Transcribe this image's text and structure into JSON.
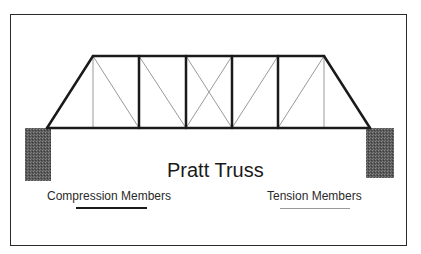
{
  "diagram": {
    "title": "Pratt Truss",
    "legend": {
      "compression": {
        "label": "Compression Members",
        "color": "#1a1a1a",
        "line_style": "thick"
      },
      "tension": {
        "label": "Tension Members",
        "color": "#9a9a9a",
        "line_style": "thin"
      }
    },
    "truss": {
      "type": "Pratt",
      "panels": 7,
      "bottom_nodes_x": [
        47,
        93,
        139,
        186,
        232,
        278,
        324,
        370
      ],
      "top_nodes_x": [
        93,
        139,
        186,
        232,
        278,
        324
      ],
      "top_chord_y": 56,
      "bottom_chord_y": 128,
      "compression_members": [
        "top-chord",
        "left-end-post",
        "right-end-post",
        "bottom-chord",
        "vertical-2",
        "vertical-3",
        "vertical-4",
        "vertical-5"
      ],
      "tension_members": [
        "vertical-1",
        "vertical-6",
        "diagonal-1",
        "diagonal-2",
        "diagonal-3a",
        "diagonal-3b",
        "diagonal-4",
        "diagonal-5"
      ]
    },
    "supports": [
      {
        "name": "left-support",
        "x": 25,
        "y": 128,
        "width": 26,
        "height": 53
      },
      {
        "name": "right-support",
        "x": 366,
        "y": 128,
        "width": 28,
        "height": 50
      }
    ],
    "colors": {
      "frame": "#2a2a2a",
      "support_fill": "#5a5a5a",
      "compression": "#1a1a1a",
      "tension": "#9a9a9a"
    }
  }
}
